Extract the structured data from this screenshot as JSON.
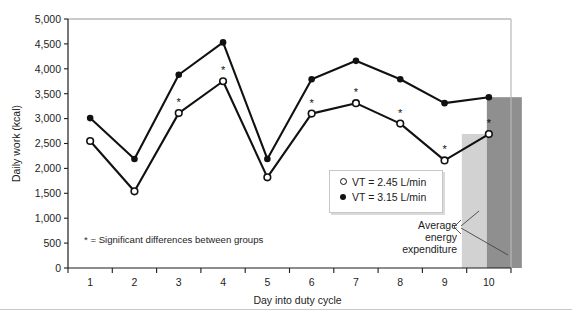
{
  "chart_data": {
    "type": "line",
    "title": "",
    "xlabel": "Day into duty cycle",
    "ylabel": "Daily work (kcal)",
    "x": [
      1,
      2,
      3,
      4,
      5,
      6,
      7,
      8,
      9,
      10
    ],
    "xtick_labels": [
      "1",
      "2",
      "3",
      "4",
      "5",
      "6",
      "7",
      "8",
      "9",
      "10"
    ],
    "ytick_labels": [
      "0",
      "500",
      "1,000",
      "1,500",
      "2,000",
      "2,500",
      "3,000",
      "3,500",
      "4,000",
      "4,500",
      "5,000"
    ],
    "ytick_values": [
      0,
      500,
      1000,
      1500,
      2000,
      2500,
      3000,
      3500,
      4000,
      4500,
      5000
    ],
    "ylim": [
      0,
      5000
    ],
    "xlim": [
      0.5,
      10.5
    ],
    "grid": false,
    "legend_position": "center-right",
    "series": [
      {
        "name": "VT = 2.45 L/min",
        "marker": "open-circle",
        "values": [
          2550,
          1540,
          3110,
          3750,
          1820,
          3100,
          3310,
          2900,
          2160,
          2690
        ],
        "significant": [
          false,
          false,
          true,
          true,
          false,
          true,
          true,
          true,
          true,
          true
        ]
      },
      {
        "name": "VT = 3.15 L/min",
        "marker": "filled-circle",
        "values": [
          3010,
          2190,
          3880,
          4530,
          2190,
          3790,
          4160,
          3790,
          3310,
          3430
        ],
        "significant": [
          false,
          false,
          false,
          false,
          false,
          false,
          false,
          false,
          false,
          false
        ]
      }
    ],
    "bars": [
      {
        "name": "average-energy-expenditure-low",
        "value": 2690,
        "color": "#d2d2d2"
      },
      {
        "name": "average-energy-expenditure-high",
        "value": 3430,
        "color": "#8f8f8f"
      }
    ],
    "annotations": [
      {
        "name": "significance-note",
        "text": "* = Significant differences between groups"
      },
      {
        "name": "average-energy-callout",
        "lines": [
          "Average",
          "energy",
          "expenditure"
        ]
      }
    ]
  },
  "legend": {
    "items": [
      {
        "label": "VT = 2.45 L/min",
        "marker": "open-circle"
      },
      {
        "label": "VT = 3.15 L/min",
        "marker": "filled-circle"
      }
    ]
  },
  "colors": {
    "line": "#111111",
    "bar_light": "#d2d2d2",
    "bar_dark": "#8f8f8f",
    "axis": "#1d1d1d",
    "frame_top": "#b8b8b8",
    "rule": "#c9c9c9"
  },
  "caption": {
    "text": ""
  }
}
